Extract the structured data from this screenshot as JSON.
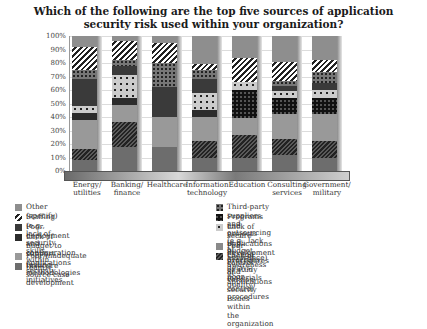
{
  "title_line1": "Which of the following are the top five sources of application",
  "title_line2": "security risk used within your organization?",
  "y_ticks": [
    "100%",
    "90%",
    "80%",
    "70%",
    "60%",
    "50%",
    "40%",
    "30%",
    "20%",
    "10%",
    "0%"
  ],
  "categories": [
    {
      "line1": "Energy/",
      "line2": "utilities"
    },
    {
      "line1": "Banking/",
      "line2": "finance"
    },
    {
      "line1": "Healthcare",
      "line2": ""
    },
    {
      "line1": "Information",
      "line2": "technology"
    },
    {
      "line1": "Education",
      "line2": ""
    },
    {
      "line1": "Consulting",
      "line2": "services"
    },
    {
      "line1": "Government/",
      "line2": "military"
    }
  ],
  "legend": {
    "left": [
      {
        "key": "other",
        "label": "Other (specify)",
        "line2": ""
      },
      {
        "key": "staff",
        "label": "Staffing (e.g., lack of security skills within team)",
        "line2": ""
      },
      {
        "key": "deploy",
        "label": "Poor deployment and configuration",
        "line2": ""
      },
      {
        "key": "budget",
        "label": "Lack of budget to support applications",
        "line2": "security initiatives"
      },
      {
        "key": "testing",
        "label": "Poor/inadequate testing methodologies",
        "line2": ""
      },
      {
        "key": "insecure",
        "label": "Insecure source case development",
        "line2": ""
      }
    ],
    "right": [
      {
        "key": "third",
        "label": "Third-party suppliers and outsourcing (e.g., lack of assurance)",
        "line2": ""
      },
      {
        "key": "programs",
        "label": "Programs and projects (e.g., budget overruns, delays, poor quality)",
        "line2": ""
      },
      {
        "key": "lacksecure",
        "label": "Lack of secure applications development procedures",
        "line2": "or study materials"
      },
      {
        "key": "change",
        "label": "Poor change control and version control procedures",
        "line2": ""
      },
      {
        "key": "aware",
        "label": "Lack of awareness of applications security issues within",
        "line2": "the organization"
      }
    ]
  },
  "chart_data": {
    "type": "bar",
    "stacked": true,
    "title": "Which of the following are the top five sources of application security risk used within your organization?",
    "xlabel": "",
    "ylabel": "",
    "ylim": [
      0,
      100
    ],
    "y_unit": "%",
    "grid": true,
    "legend_position": "bottom",
    "categories": [
      "Energy/utilities",
      "Banking/finance",
      "Healthcare",
      "Information technology",
      "Education",
      "Consulting services",
      "Government/military"
    ],
    "series": [
      {
        "name": "Insecure source case development",
        "key": "insecure",
        "values": [
          8,
          18,
          18,
          10,
          10,
          12,
          10
        ]
      },
      {
        "name": "Lack of awareness of applications security issues within the organization",
        "key": "aware",
        "values": [
          8,
          18,
          0,
          12,
          17,
          12,
          12
        ]
      },
      {
        "name": "Poor/inadequate testing methodologies",
        "key": "testing",
        "values": [
          22,
          13,
          22,
          18,
          12,
          18,
          20
        ]
      },
      {
        "name": "Lack of budget to support applications security initiatives",
        "key": "budget",
        "values": [
          5,
          5,
          0,
          5,
          0,
          0,
          0
        ]
      },
      {
        "name": "Programs and projects (e.g., budget overruns, delays, poor quality)",
        "key": "programs",
        "values": [
          0,
          0,
          0,
          0,
          21,
          12,
          12
        ]
      },
      {
        "name": "Lack of secure applications development procedures or study materials",
        "key": "lacksecure",
        "values": [
          5,
          17,
          0,
          13,
          6,
          5,
          6
        ]
      },
      {
        "name": "Poor deployment and configuration",
        "key": "deploy",
        "values": [
          20,
          7,
          22,
          10,
          0,
          4,
          5
        ]
      },
      {
        "name": "Third-party suppliers and outsourcing (e.g., lack of assurance)",
        "key": "third",
        "values": [
          7,
          4,
          18,
          7,
          0,
          4,
          8
        ]
      },
      {
        "name": "Staffing (e.g., lack of security skills within team)",
        "key": "staff",
        "values": [
          17,
          14,
          15,
          4,
          18,
          14,
          9
        ]
      },
      {
        "name": "Other (specify)",
        "key": "other",
        "values": [
          8,
          4,
          5,
          21,
          16,
          19,
          18
        ]
      }
    ]
  }
}
